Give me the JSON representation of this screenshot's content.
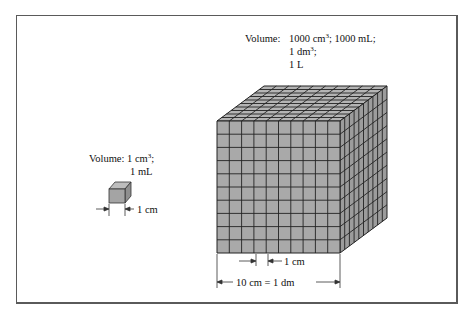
{
  "large_cube": {
    "volume_label": "Volume:",
    "line1": "1000 cm",
    "line1_exp": "3",
    "line1_rest": "; 1000 mL;",
    "line2": "1 dm",
    "line2_exp": "3",
    "line2_rest": ";",
    "line3": "1 L",
    "unit_dimension": "1 cm",
    "edge_dimension": "10 cm = 1 dm",
    "grid_divisions": 10
  },
  "small_cube": {
    "volume_label": "Volume:",
    "line1": "1 cm",
    "line1_exp": "3",
    "line1_rest": ";",
    "line2": "1 mL",
    "edge_dimension": "1 cm"
  },
  "colors": {
    "cube_face": "#a9a9a9",
    "grid_line": "#222222",
    "frame": "#5a5a5a"
  }
}
